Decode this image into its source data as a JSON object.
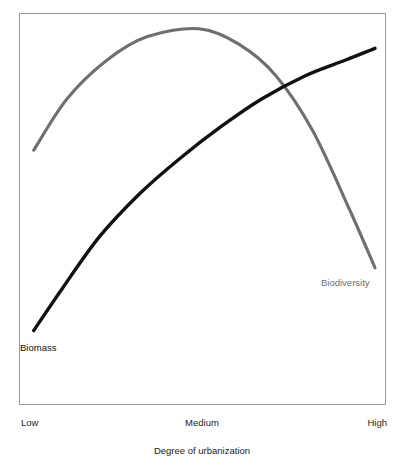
{
  "chart_data": {
    "type": "line",
    "title": "",
    "subtitle": "",
    "xlabel": "Degree of urbanization",
    "ylabel": "",
    "grid": false,
    "legend_position": "inline-annotation",
    "x_tick_labels": [
      "Low",
      "Medium",
      "High"
    ],
    "x_tick_positions": [
      0,
      0.5,
      1
    ],
    "xlim": [
      0,
      1
    ],
    "ylim": [
      0,
      1
    ],
    "y_axis_ticks_visible": false,
    "frame": "box",
    "series": [
      {
        "name": "Biomass",
        "color": "#111111",
        "annotation": "Biomass",
        "shape": "saturating-increase",
        "x": [
          0.04,
          0.12,
          0.22,
          0.33,
          0.44,
          0.55,
          0.66,
          0.78,
          0.89,
          0.97
        ],
        "values": [
          0.19,
          0.3,
          0.43,
          0.54,
          0.63,
          0.71,
          0.78,
          0.84,
          0.88,
          0.91
        ]
      },
      {
        "name": "Biodiversity",
        "color": "#6f6f6f",
        "annotation": "Biodiversity",
        "shape": "inverted-u",
        "x": [
          0.04,
          0.13,
          0.24,
          0.35,
          0.49,
          0.6,
          0.7,
          0.8,
          0.9,
          0.97
        ],
        "values": [
          0.65,
          0.78,
          0.88,
          0.94,
          0.96,
          0.92,
          0.84,
          0.7,
          0.5,
          0.35
        ]
      }
    ],
    "annotations": [
      {
        "text": "Biomass",
        "color": "#111111",
        "series": "Biomass"
      },
      {
        "text": "Biodiversity",
        "color": "#6f6f6f",
        "series": "Biodiversity"
      }
    ]
  },
  "axis": {
    "x_title": "Degree of urbanization",
    "ticks": {
      "low": "Low",
      "medium": "Medium",
      "high": "High"
    }
  },
  "labels": {
    "biomass": "Biomass",
    "biodiversity": "Biodiversity"
  },
  "colors": {
    "biomass_line": "#111111",
    "biodiversity_line": "#6f6f6f",
    "frame_border": "#9a9a9a",
    "text": "#1c1c1c",
    "background": "#ffffff"
  }
}
